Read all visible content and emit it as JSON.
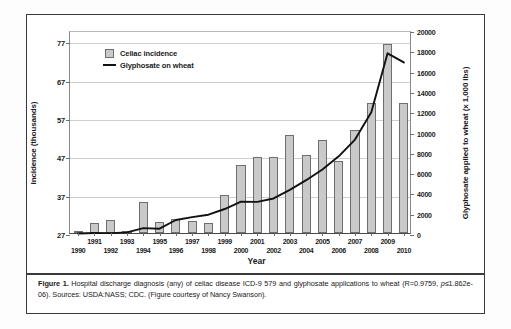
{
  "figure": {
    "caption_label": "Figure 1.",
    "caption_body": " Hospital discharge diagnosis (any) of celiac disease ICD-9 579 and glyphosate applications to wheat (R=0.9759, ",
    "caption_stat_italic": "p",
    "caption_stat_rest": "≤1.862e-06).",
    "caption_sources": "Sources: USDA:NASS; CDC. (Figure courtesy of Nancy Swanson)."
  },
  "legend": {
    "position": "top-left-inside",
    "items": [
      {
        "label": "Celiac incidence",
        "marker": "bar-swatch",
        "color": "#c9c9c9"
      },
      {
        "label": "Glyphosate on wheat",
        "marker": "line",
        "color": "#111111"
      }
    ]
  },
  "chart_data": {
    "type": "bar",
    "title": "",
    "xlabel": "Year",
    "ylabel": "Incidence (thousands)",
    "y2label": "Glyphosate applied to wheat (x 1,000 lbs)",
    "grid": true,
    "categories": [
      "1990",
      "1991",
      "1992",
      "1993",
      "1994",
      "1995",
      "1996",
      "1997",
      "1998",
      "1999",
      "2000",
      "2001",
      "2002",
      "2003",
      "2004",
      "2005",
      "2006",
      "2007",
      "2008",
      "2009",
      "2010"
    ],
    "ylim": [
      27,
      80
    ],
    "yticks": [
      27,
      37,
      47,
      57,
      67,
      77
    ],
    "ytick_labels": [
      "27",
      "37",
      "47",
      "57",
      "67",
      "77"
    ],
    "y2lim": [
      0,
      20000
    ],
    "y2ticks": [
      0,
      2000,
      4000,
      6000,
      8000,
      10000,
      12000,
      14000,
      16000,
      18000,
      20000
    ],
    "y2tick_labels": [
      "0",
      "2000",
      "4000",
      "6000",
      "8000",
      "10000",
      "12000",
      "14000",
      "16000",
      "18000",
      "20000"
    ],
    "series": [
      {
        "name": "Celiac incidence",
        "axis": "left",
        "type": "bar",
        "color": "#c9c9c9",
        "values": [
          27.4,
          29.7,
          30.3,
          27.4,
          35.2,
          29.8,
          30.6,
          30.2,
          29.6,
          36.9,
          44.8,
          46.9,
          46.8,
          52.6,
          47.4,
          51.4,
          45.8,
          53.8,
          61.0,
          76.4,
          61.0
        ]
      },
      {
        "name": "Glyphosate on wheat",
        "axis": "right",
        "type": "line",
        "color": "#111111",
        "values": [
          150,
          200,
          180,
          260,
          680,
          620,
          1480,
          1760,
          2000,
          2560,
          3280,
          3260,
          3600,
          4450,
          5400,
          6450,
          7750,
          9400,
          12100,
          17900,
          17000
        ]
      }
    ]
  }
}
